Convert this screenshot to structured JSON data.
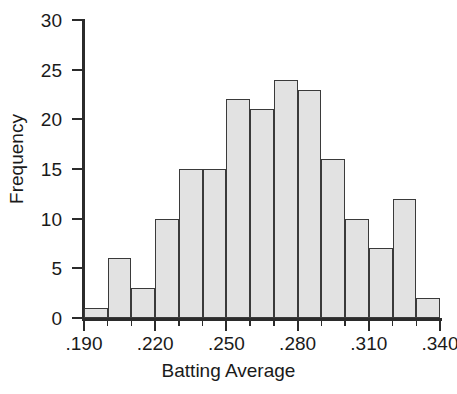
{
  "chart_data": {
    "type": "bar",
    "title": "",
    "xlabel": "Batting Average",
    "ylabel": "Frequency",
    "categories": [
      ".190-.200",
      ".200-.210",
      ".210-.220",
      ".220-.230",
      ".230-.240",
      ".240-.250",
      ".250-.260",
      ".260-.270",
      ".270-.280",
      ".280-.290",
      ".290-.300",
      ".300-.310",
      ".310-.320",
      ".320-.330",
      ".330-.340"
    ],
    "bin_edges": [
      0.19,
      0.2,
      0.21,
      0.22,
      0.23,
      0.24,
      0.25,
      0.26,
      0.27,
      0.28,
      0.29,
      0.3,
      0.31,
      0.32,
      0.33,
      0.34
    ],
    "values": [
      1,
      6,
      3,
      10,
      15,
      15,
      22,
      21,
      24,
      23,
      16,
      10,
      7,
      12,
      2
    ],
    "xlim": [
      0.19,
      0.34
    ],
    "ylim": [
      0,
      30
    ],
    "ytick_values": [
      0,
      5,
      10,
      15,
      20,
      25,
      30
    ],
    "ytick_labels": [
      "0",
      "5",
      "10",
      "15",
      "20",
      "25",
      "30"
    ],
    "xtick_values": [
      0.19,
      0.22,
      0.25,
      0.28,
      0.31,
      0.34
    ],
    "xtick_labels": [
      ".190",
      ".220",
      ".250",
      ".280",
      ".310",
      ".340"
    ],
    "grid": false,
    "legend": false,
    "bar_fill_color": "#e2e2e2",
    "bar_edge_color": "#3a3a3a",
    "axis_color": "#2b2b2b",
    "text_color": "#1a1a1a",
    "background_color": "#ffffff"
  }
}
